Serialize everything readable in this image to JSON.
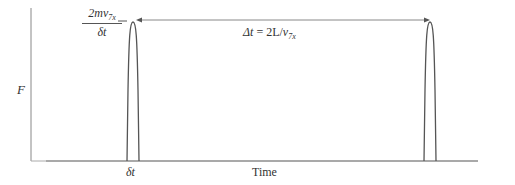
{
  "diagram": {
    "title": "",
    "y_axis_label": "F",
    "x_axis_label": "Time",
    "peak_label": {
      "numerator": "2mv",
      "numerator_sub": "7x",
      "denominator": "δt"
    },
    "interval_label": {
      "lhs": "Δt",
      "equals": " = 2L/",
      "v": "v",
      "v_sub": "7x"
    },
    "pulse_width_label": "δt",
    "colors": {
      "line": "#555555",
      "axis": "#777777",
      "text": "#333333"
    }
  }
}
